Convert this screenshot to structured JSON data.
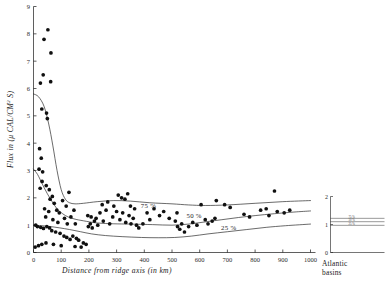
{
  "figure": {
    "background": "#ffffff",
    "ink_color": "#1a1a1a",
    "point_color": "#101010"
  },
  "chart_data": {
    "type": "scatter",
    "title": "",
    "xlabel": "Distance from ridge axis (in km)",
    "ylabel": "Flux in (μ CAL/CM² S)",
    "ylabel_parts": {
      "prefix": "Flux in (",
      "unit_main": "μ CAL/CM",
      "unit_sup": "2",
      "unit_tail": " S)"
    },
    "xlim": [
      0,
      1000
    ],
    "ylim": [
      0,
      9
    ],
    "xticks": [
      0,
      100,
      200,
      300,
      400,
      500,
      600,
      700,
      800,
      900,
      1000
    ],
    "xticklabels": [
      "0",
      "100",
      "200",
      "300",
      "400",
      "500",
      "600",
      "700",
      "800",
      "900",
      "1000"
    ],
    "yticks": [
      0,
      1,
      2,
      3,
      4,
      5,
      6,
      7,
      8,
      9
    ],
    "yticklabels": [
      "0",
      "1",
      "2",
      "3",
      "4",
      "5",
      "6",
      "7",
      "8",
      "9"
    ],
    "grid": false,
    "legend": "none",
    "points": [
      [
        52,
        8.15
      ],
      [
        38,
        7.8
      ],
      [
        63,
        7.3
      ],
      [
        35,
        6.5
      ],
      [
        25,
        6.2
      ],
      [
        62,
        6.25
      ],
      [
        30,
        5.25
      ],
      [
        47,
        5.1
      ],
      [
        50,
        4.9
      ],
      [
        22,
        3.8
      ],
      [
        28,
        3.45
      ],
      [
        20,
        3.05
      ],
      [
        33,
        2.95
      ],
      [
        24,
        2.35
      ],
      [
        31,
        2.6
      ],
      [
        46,
        2.45
      ],
      [
        57,
        2.3
      ],
      [
        68,
        2.05
      ],
      [
        60,
        1.95
      ],
      [
        75,
        1.8
      ],
      [
        40,
        1.6
      ],
      [
        55,
        1.5
      ],
      [
        84,
        1.55
      ],
      [
        93,
        1.45
      ],
      [
        44,
        1.3
      ],
      [
        70,
        1.2
      ],
      [
        88,
        1.1
      ],
      [
        105,
        1.9
      ],
      [
        118,
        1.7
      ],
      [
        128,
        2.2
      ],
      [
        112,
        1.25
      ],
      [
        122,
        1.05
      ],
      [
        135,
        1.3
      ],
      [
        146,
        1.55
      ],
      [
        151,
        1.05
      ],
      [
        8,
        1.0
      ],
      [
        14,
        0.95
      ],
      [
        26,
        0.92
      ],
      [
        36,
        0.88
      ],
      [
        48,
        0.95
      ],
      [
        58,
        0.9
      ],
      [
        66,
        0.8
      ],
      [
        80,
        0.75
      ],
      [
        96,
        0.7
      ],
      [
        110,
        0.6
      ],
      [
        120,
        0.55
      ],
      [
        132,
        0.48
      ],
      [
        142,
        0.6
      ],
      [
        155,
        0.52
      ],
      [
        163,
        0.45
      ],
      [
        6,
        0.2
      ],
      [
        18,
        0.25
      ],
      [
        30,
        0.3
      ],
      [
        45,
        0.35
      ],
      [
        72,
        0.3
      ],
      [
        100,
        0.25
      ],
      [
        150,
        0.22
      ],
      [
        172,
        0.2
      ],
      [
        180,
        0.35
      ],
      [
        190,
        0.3
      ],
      [
        198,
        0.95
      ],
      [
        205,
        1.05
      ],
      [
        212,
        0.9
      ],
      [
        220,
        1.15
      ],
      [
        232,
        1.0
      ],
      [
        196,
        1.35
      ],
      [
        208,
        1.3
      ],
      [
        226,
        1.25
      ],
      [
        240,
        1.45
      ],
      [
        252,
        1.15
      ],
      [
        262,
        1.55
      ],
      [
        275,
        1.05
      ],
      [
        286,
        1.3
      ],
      [
        248,
        1.75
      ],
      [
        268,
        1.85
      ],
      [
        290,
        1.7
      ],
      [
        300,
        1.5
      ],
      [
        312,
        1.2
      ],
      [
        322,
        1.45
      ],
      [
        333,
        1.1
      ],
      [
        345,
        1.35
      ],
      [
        306,
        2.1
      ],
      [
        318,
        2.0
      ],
      [
        330,
        1.95
      ],
      [
        340,
        2.15
      ],
      [
        352,
        1.05
      ],
      [
        360,
        1.25
      ],
      [
        372,
        1.0
      ],
      [
        380,
        0.9
      ],
      [
        350,
        1.7
      ],
      [
        365,
        1.6
      ],
      [
        395,
        1.05
      ],
      [
        410,
        1.45
      ],
      [
        420,
        1.2
      ],
      [
        435,
        1.6
      ],
      [
        455,
        1.35
      ],
      [
        470,
        1.5
      ],
      [
        490,
        1.25
      ],
      [
        512,
        1.15
      ],
      [
        520,
        0.95
      ],
      [
        528,
        0.85
      ],
      [
        535,
        1.05
      ],
      [
        545,
        0.75
      ],
      [
        518,
        1.45
      ],
      [
        560,
        0.95
      ],
      [
        575,
        1.1
      ],
      [
        590,
        1.0
      ],
      [
        605,
        1.75
      ],
      [
        620,
        1.2
      ],
      [
        630,
        1.05
      ],
      [
        645,
        1.15
      ],
      [
        655,
        1.25
      ],
      [
        660,
        1.9
      ],
      [
        690,
        1.75
      ],
      [
        710,
        1.65
      ],
      [
        760,
        1.4
      ],
      [
        780,
        1.3
      ],
      [
        820,
        1.55
      ],
      [
        840,
        1.6
      ],
      [
        850,
        1.35
      ],
      [
        870,
        2.25
      ],
      [
        880,
        1.5
      ],
      [
        905,
        1.45
      ],
      [
        925,
        1.55
      ]
    ],
    "curves": [
      {
        "name": "75 %",
        "label": "75 %",
        "label_x": 415,
        "label_y": 1.62,
        "points": [
          [
            0,
            5.8
          ],
          [
            18,
            5.7
          ],
          [
            38,
            5.35
          ],
          [
            55,
            4.7
          ],
          [
            70,
            3.9
          ],
          [
            85,
            3.0
          ],
          [
            100,
            2.3
          ],
          [
            115,
            1.95
          ],
          [
            130,
            1.82
          ],
          [
            150,
            1.78
          ],
          [
            180,
            1.8
          ],
          [
            230,
            1.86
          ],
          [
            290,
            1.9
          ],
          [
            350,
            1.88
          ],
          [
            420,
            1.82
          ],
          [
            500,
            1.78
          ],
          [
            560,
            1.74
          ],
          [
            620,
            1.72
          ],
          [
            700,
            1.74
          ],
          [
            800,
            1.8
          ],
          [
            900,
            1.86
          ],
          [
            1000,
            1.9
          ]
        ]
      },
      {
        "name": "50 %",
        "label": "50 %",
        "label_x": 580,
        "label_y": 1.28,
        "points": [
          [
            0,
            3.05
          ],
          [
            15,
            2.85
          ],
          [
            32,
            2.5
          ],
          [
            50,
            2.15
          ],
          [
            68,
            1.85
          ],
          [
            85,
            1.6
          ],
          [
            105,
            1.42
          ],
          [
            125,
            1.3
          ],
          [
            150,
            1.22
          ],
          [
            180,
            1.16
          ],
          [
            230,
            1.08
          ],
          [
            290,
            1.05
          ],
          [
            350,
            1.04
          ],
          [
            430,
            1.02
          ],
          [
            500,
            1.0
          ],
          [
            560,
            1.04
          ],
          [
            620,
            1.12
          ],
          [
            680,
            1.2
          ],
          [
            740,
            1.28
          ],
          [
            800,
            1.35
          ],
          [
            870,
            1.42
          ],
          [
            940,
            1.48
          ],
          [
            1000,
            1.52
          ]
        ]
      },
      {
        "name": "25 %",
        "label": "25 %",
        "label_x": 705,
        "label_y": 0.84,
        "points": [
          [
            0,
            1.0
          ],
          [
            30,
            0.98
          ],
          [
            60,
            0.95
          ],
          [
            95,
            0.9
          ],
          [
            130,
            0.84
          ],
          [
            170,
            0.76
          ],
          [
            210,
            0.68
          ],
          [
            260,
            0.62
          ],
          [
            320,
            0.58
          ],
          [
            390,
            0.55
          ],
          [
            450,
            0.54
          ],
          [
            510,
            0.55
          ],
          [
            570,
            0.6
          ],
          [
            630,
            0.68
          ],
          [
            700,
            0.76
          ],
          [
            770,
            0.84
          ],
          [
            840,
            0.92
          ],
          [
            910,
            0.98
          ],
          [
            1000,
            1.04
          ]
        ]
      }
    ]
  },
  "inset": {
    "caption_line1": "Atlantic",
    "caption_line2": "basins",
    "ylim": [
      0,
      2
    ],
    "yticks": [
      0,
      1,
      2
    ],
    "yticklabels": [
      "0",
      "1",
      "2"
    ],
    "levels": [
      {
        "label": "75 %",
        "value": 1.22
      },
      {
        "label": "50 %",
        "value": 1.1
      },
      {
        "label": "25 %",
        "value": 0.97
      }
    ]
  }
}
